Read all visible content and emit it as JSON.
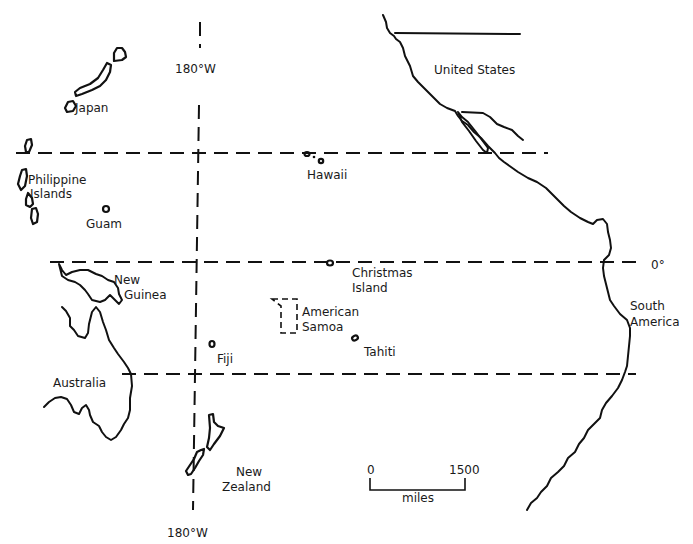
{
  "map": {
    "gridlines": {
      "meridian_top": "180°W",
      "meridian_bottom": "180°W",
      "equator": "0°"
    },
    "labels": {
      "japan": "Japan",
      "philippines_1": "Philippine",
      "philippines_2": "Islands",
      "guam": "Guam",
      "hawaii": "Hawaii",
      "united_states": "United States",
      "christmas_1": "Christmas",
      "christmas_2": "Island",
      "new_guinea_1": "New",
      "new_guinea_2": "Guinea",
      "american_samoa_1": "American",
      "american_samoa_2": "Samoa",
      "tahiti": "Tahiti",
      "fiji": "Fiji",
      "australia": "Australia",
      "south_america_1": "South",
      "south_america_2": "America",
      "new_zealand_1": "New",
      "new_zealand_2": "Zealand"
    },
    "scale_bar": {
      "start": "0",
      "end": "1500",
      "unit": "miles"
    }
  }
}
